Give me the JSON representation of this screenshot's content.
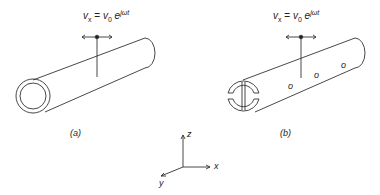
{
  "figure": {
    "panel_a": {
      "label": "(a)",
      "equation": {
        "lhs": "v",
        "lhs_sub": "x",
        "eq": " = ",
        "rhs": "v",
        "rhs_sub": "0",
        "exp_base": " e",
        "exp": "jωt"
      }
    },
    "panel_b": {
      "label": "(b)",
      "equation": {
        "lhs": "v",
        "lhs_sub": "x",
        "eq": " = ",
        "rhs": "v",
        "rhs_sub": "0",
        "exp_base": " e",
        "exp": "jωt"
      },
      "hole_labels": [
        "o",
        "o",
        "o"
      ]
    },
    "axes": {
      "z": "z",
      "x": "x",
      "y": "y"
    }
  }
}
